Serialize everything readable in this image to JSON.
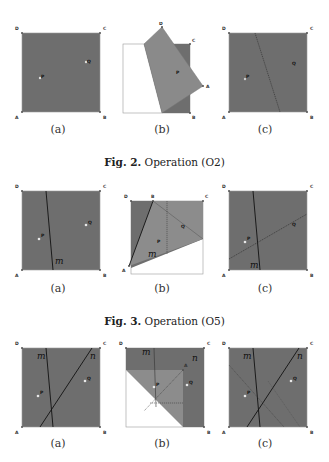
{
  "figures": [
    {
      "caption_prefix": "Fig. 2.",
      "caption_text": " Operation (O2)",
      "panels": [
        {
          "label": "(a)",
          "vertices": [
            "A",
            "B",
            "C",
            "D"
          ],
          "points": [
            "P",
            "Q"
          ]
        },
        {
          "label": "(b)",
          "vertices": [
            "A",
            "B",
            "C",
            "D"
          ],
          "points": [
            "P"
          ]
        },
        {
          "label": "(c)",
          "vertices": [
            "A",
            "B",
            "C",
            "D"
          ],
          "points": [
            "P",
            "Q"
          ]
        }
      ]
    },
    {
      "caption_prefix": "Fig. 3.",
      "caption_text": " Operation (O5)",
      "panels": [
        {
          "label": "(a)",
          "vertices": [
            "A",
            "B",
            "C",
            "D"
          ],
          "points": [
            "P",
            "Q"
          ],
          "lines": [
            "m"
          ]
        },
        {
          "label": "(b)",
          "vertices": [
            "A",
            "B",
            "C",
            "D"
          ],
          "points": [
            "P",
            "Q"
          ],
          "lines": [
            "m"
          ]
        },
        {
          "label": "(c)",
          "vertices": [
            "A",
            "B",
            "C",
            "D"
          ],
          "points": [
            "P",
            "Q"
          ],
          "lines": [
            "m"
          ]
        }
      ]
    },
    {
      "caption_prefix": "",
      "caption_text": "",
      "panels": [
        {
          "label": "(a)",
          "vertices": [
            "A",
            "B",
            "C",
            "D"
          ],
          "points": [
            "P",
            "Q"
          ],
          "lines": [
            "m",
            "n"
          ]
        },
        {
          "label": "(b)",
          "vertices": [
            "A",
            "B",
            "C",
            "D"
          ],
          "points": [
            "P",
            "Q"
          ],
          "lines": [
            "m",
            "n"
          ]
        },
        {
          "label": "(c)",
          "vertices": [
            "A",
            "B",
            "C",
            "D"
          ],
          "points": [
            "P",
            "Q"
          ],
          "lines": [
            "m",
            "n"
          ]
        }
      ]
    }
  ],
  "labels": {
    "A": "A",
    "B": "B",
    "C": "C",
    "D": "D",
    "P": "P",
    "Q": "Q",
    "m": "m",
    "n": "n"
  },
  "colors": {
    "paper": "#6e6e6e",
    "folded": "#8c8c8c",
    "outline": "#9a9a9a",
    "crease": "#1a1a1a",
    "point": "#e8e8e8"
  }
}
